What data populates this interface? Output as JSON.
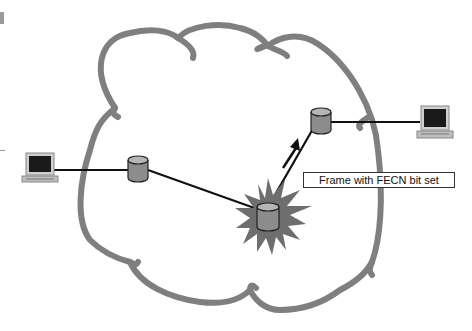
{
  "diagram": {
    "label": "Frame with FECN bit set",
    "colors": {
      "cloud": "#7f7f7f",
      "link": "#111111",
      "switch_body": "#8c8c8c",
      "switch_top": "#b5b5b5",
      "congestion_burst": "#6e6e6e",
      "screen": "#1a1a1a",
      "pc_case": "#cfcfcf"
    },
    "nodes": [
      {
        "id": "pc-left",
        "type": "computer",
        "x": 34,
        "y": 163
      },
      {
        "id": "switch-left",
        "type": "frame-relay-switch",
        "x": 138,
        "y": 166
      },
      {
        "id": "switch-congested",
        "type": "frame-relay-switch",
        "x": 267,
        "y": 215,
        "congested": true
      },
      {
        "id": "switch-right",
        "type": "frame-relay-switch",
        "x": 320,
        "y": 118
      },
      {
        "id": "pc-right",
        "type": "computer",
        "x": 434,
        "y": 122
      }
    ],
    "links": [
      {
        "from": "pc-left",
        "to": "switch-left"
      },
      {
        "from": "switch-left",
        "to": "switch-congested"
      },
      {
        "from": "switch-congested",
        "to": "switch-right"
      },
      {
        "from": "switch-right",
        "to": "pc-right"
      }
    ],
    "arrow": {
      "direction": "up-right",
      "meaning": "forward direction of frame"
    }
  }
}
